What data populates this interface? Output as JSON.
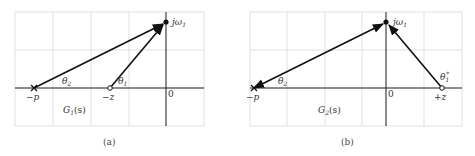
{
  "panels": [
    {
      "id": "a",
      "caption": "(a)",
      "transfer_label": "G",
      "transfer_sub": "1",
      "transfer_arg": "(s)",
      "pole_label": "−p",
      "zero_label": "−z",
      "origin_label": "0",
      "point_label": "jω",
      "point_sub": "1",
      "angle_pole_label": "θ",
      "angle_pole_sub": "2",
      "angle_zero_label": "θ",
      "angle_zero_sub": "1"
    },
    {
      "id": "b",
      "caption": "(b)",
      "transfer_label": "G",
      "transfer_sub": "2",
      "transfer_arg": "(s)",
      "pole_label": "−p",
      "zero_label": "+z",
      "origin_label": "0",
      "point_label": "jω",
      "point_sub": "1",
      "angle_pole_label": "θ",
      "angle_pole_sub": "2",
      "angle_zero_label": "θ",
      "angle_zero_sub": "1",
      "angle_zero_sup": "*"
    }
  ],
  "colors": {
    "grid": "#d9d9d9",
    "axis": "#1a1a1a",
    "vector": "#111111",
    "text": "#333333"
  }
}
